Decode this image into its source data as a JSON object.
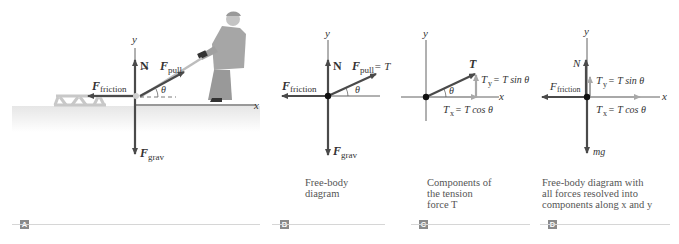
{
  "colors": {
    "arrow_dark": "#4a4a4a",
    "arrow_light": "#a8a8a8",
    "axis": "#3a3a3a",
    "ground": "#eeeeee",
    "badge": "#8a8a8a",
    "rule": "#d6d6d6"
  },
  "panels": [
    {
      "id": "A",
      "badge": "A",
      "caption": "",
      "axes": {
        "x": "x",
        "y": "y"
      },
      "labels": {
        "normal": "N",
        "pull": "F",
        "pull_sub": "pull",
        "friction": "F",
        "friction_sub": "friction",
        "grav": "F",
        "grav_sub": "grav",
        "angle": "θ"
      }
    },
    {
      "id": "B",
      "badge": "B",
      "caption_lines": [
        "Free-body",
        "diagram"
      ],
      "axes": {
        "x": "x",
        "y": "y"
      },
      "labels": {
        "normal": "N",
        "pull": "F",
        "pull_sub": "pull",
        "pull_eq": " = T",
        "friction": "F",
        "friction_sub": "friction",
        "grav": "F",
        "grav_sub": "grav",
        "angle": "θ"
      }
    },
    {
      "id": "C",
      "badge": "C",
      "caption_lines": [
        "Components of",
        "the tension",
        "force T"
      ],
      "axes": {
        "x": "x",
        "y": "y"
      },
      "labels": {
        "tension": "T",
        "ty": "T",
        "ty_sub": "y",
        "ty_eq": " = T sin θ",
        "tx": "T",
        "tx_sub": "x",
        "tx_eq": " = T cos θ",
        "angle": "θ"
      }
    },
    {
      "id": "D",
      "badge": "D",
      "caption_lines": [
        "Free-body diagram with",
        "all forces resolved into",
        "components along x and y"
      ],
      "axes": {
        "x": "x",
        "y": "y"
      },
      "labels": {
        "normal": "N",
        "friction": "F",
        "friction_sub": "friction",
        "ty": "T",
        "ty_sub": "y",
        "ty_eq": " = T sin θ",
        "tx": "T",
        "tx_sub": "x",
        "tx_eq": " = T cos θ",
        "grav": "mg"
      }
    }
  ]
}
